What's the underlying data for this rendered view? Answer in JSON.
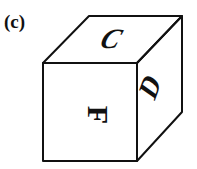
{
  "figure": {
    "label": "(c)",
    "type": "cube",
    "faces": {
      "top": "C",
      "front": "F",
      "right": "D"
    },
    "colors": {
      "stroke": "#111111",
      "background": "#ffffff"
    }
  }
}
